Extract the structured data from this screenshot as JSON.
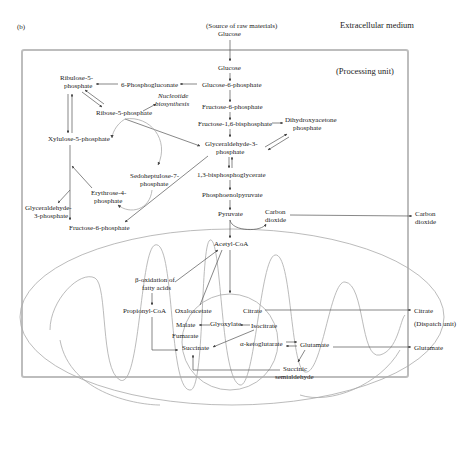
{
  "figure": {
    "panel_label": "(b)",
    "regions": {
      "extracellular": "Extracellular medium",
      "processing": "(Processing unit)",
      "dispatch": "(Dispatch unit)"
    },
    "source": {
      "line1": "(Source of raw materials)",
      "line2": "Glucose"
    },
    "nodes": {
      "glucose": "Glucose",
      "g6p": "Glucose-6-phosphate",
      "f6p": "Fructose-6-phosphate",
      "f16bp": "Fructose-1,6-bisphosphate",
      "dhap_1": "Dihydroxyacetone",
      "dhap_2": "phosphate",
      "g3p_1": "Glyceraldehyde-3-",
      "g3p_2": "phosphate",
      "bpg": "1,3-bisphosphoglycerate",
      "pep": "Phosphoenolpyruvate",
      "pyruvate": "Pyruvate",
      "co2_in_1": "Carbon",
      "co2_in_2": "dioxide",
      "co2_out_1": "Carbon",
      "co2_out_2": "dioxide",
      "pg6": "6-Phosphogluconate",
      "ru5p_1": "Ribulose-5-",
      "ru5p_2": "phosphate",
      "r5p": "Ribose-5-phosphate",
      "nuc_1": "Nucleotide",
      "nuc_2": "biosynthesis",
      "x5p": "Xylulose-5-phosphate",
      "s7p_1": "Sedoheptulose-7-",
      "s7p_2": "phosphate",
      "e4p_1": "Erythrose-4-",
      "e4p_2": "phosphate",
      "g3p_left_1": "Glyceraldehyde-",
      "g3p_left_2": "3-phosphate",
      "f6p_left": "Fructose-6-phosphate",
      "acetylcoa": "Acetyl-CoA",
      "betaox_1": "β-oxidation of",
      "betaox_2": "fatty acids",
      "propionylcoa": "Propionyl-CoA",
      "oxaloacetate": "Oxaloacetate",
      "citrate": "Citrate",
      "malate": "Malate",
      "glyoxylate": "Glyoxylate",
      "isocitrate": "Isocitrate",
      "fumarate": "Fumarate",
      "succinate": "Succinate",
      "akg": "α-ketoglutarate",
      "glutamate": "Glutamate",
      "ssa_1": "Succinic",
      "ssa_2": "semialdehyde",
      "citrate_out": "Citrate",
      "glutamate_out": "Glutamate"
    }
  }
}
